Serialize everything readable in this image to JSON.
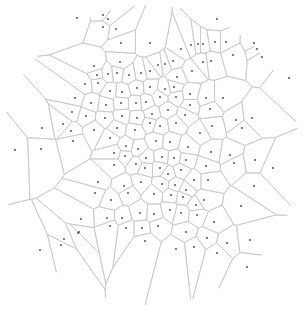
{
  "diagram": {
    "type": "voronoi",
    "width": 305,
    "height": 312,
    "colors": {
      "background": "#ffffff",
      "edge": "#c8c8c8",
      "seed": "#444444"
    },
    "clip_circle": {
      "cx": 150,
      "cy": 155,
      "r": 150
    },
    "seeds": [
      [
        103,
        15
      ],
      [
        108,
        19
      ],
      [
        103,
        27
      ],
      [
        116,
        29
      ],
      [
        77,
        18
      ],
      [
        121,
        43
      ],
      [
        150,
        43
      ],
      [
        181,
        49
      ],
      [
        217,
        19
      ],
      [
        94,
        66
      ],
      [
        120,
        62
      ],
      [
        150,
        71
      ],
      [
        173,
        61
      ],
      [
        191,
        45
      ],
      [
        198,
        44
      ],
      [
        203,
        44
      ],
      [
        215,
        42
      ],
      [
        226,
        42
      ],
      [
        254,
        43
      ],
      [
        262,
        57
      ],
      [
        289,
        78
      ],
      [
        97,
        75
      ],
      [
        108,
        74
      ],
      [
        117,
        73
      ],
      [
        129,
        75
      ],
      [
        141,
        73
      ],
      [
        158,
        65
      ],
      [
        165,
        64
      ],
      [
        177,
        77
      ],
      [
        192,
        71
      ],
      [
        203,
        62
      ],
      [
        211,
        61
      ],
      [
        233,
        55
      ],
      [
        257,
        49
      ],
      [
        85,
        84
      ],
      [
        98,
        83
      ],
      [
        110,
        91
      ],
      [
        122,
        92
      ],
      [
        137,
        88
      ],
      [
        150,
        87
      ],
      [
        165,
        89
      ],
      [
        174,
        87
      ],
      [
        190,
        94
      ],
      [
        206,
        98
      ],
      [
        223,
        98
      ],
      [
        75,
        98
      ],
      [
        91,
        103
      ],
      [
        106,
        105
      ],
      [
        121,
        103
      ],
      [
        136,
        103
      ],
      [
        146,
        102
      ],
      [
        160,
        97
      ],
      [
        176,
        97
      ],
      [
        190,
        105
      ],
      [
        210,
        109
      ],
      [
        236,
        120
      ],
      [
        72,
        112
      ],
      [
        86,
        116
      ],
      [
        105,
        118
      ],
      [
        122,
        116
      ],
      [
        137,
        118
      ],
      [
        152,
        114
      ],
      [
        168,
        110
      ],
      [
        185,
        115
      ],
      [
        212,
        126
      ],
      [
        242,
        128
      ],
      [
        252,
        118
      ],
      [
        42,
        128
      ],
      [
        63,
        124
      ],
      [
        71,
        131
      ],
      [
        73,
        141
      ],
      [
        94,
        130
      ],
      [
        117,
        128
      ],
      [
        135,
        130
      ],
      [
        150,
        123
      ],
      [
        160,
        126
      ],
      [
        176,
        123
      ],
      [
        200,
        133
      ],
      [
        15,
        150
      ],
      [
        41,
        149
      ],
      [
        73,
        141
      ],
      [
        110,
        138
      ],
      [
        126,
        146
      ],
      [
        138,
        149
      ],
      [
        156,
        141
      ],
      [
        170,
        142
      ],
      [
        188,
        147
      ],
      [
        211,
        152
      ],
      [
        230,
        155
      ],
      [
        114,
        153
      ],
      [
        125,
        156
      ],
      [
        146,
        158
      ],
      [
        162,
        157
      ],
      [
        174,
        158
      ],
      [
        186,
        160
      ],
      [
        206,
        166
      ],
      [
        234,
        163
      ],
      [
        255,
        160
      ],
      [
        273,
        168
      ],
      [
        114,
        165
      ],
      [
        136,
        164
      ],
      [
        145,
        168
      ],
      [
        160,
        168
      ],
      [
        168,
        174
      ],
      [
        181,
        170
      ],
      [
        194,
        180
      ],
      [
        208,
        180
      ],
      [
        254,
        186
      ],
      [
        98,
        182
      ],
      [
        124,
        186
      ],
      [
        141,
        182
      ],
      [
        162,
        184
      ],
      [
        175,
        185
      ],
      [
        186,
        190
      ],
      [
        204,
        200
      ],
      [
        241,
        206
      ],
      [
        95,
        193
      ],
      [
        111,
        200
      ],
      [
        128,
        193
      ],
      [
        154,
        194
      ],
      [
        171,
        195
      ],
      [
        183,
        197
      ],
      [
        196,
        205
      ],
      [
        214,
        222
      ],
      [
        81,
        219
      ],
      [
        107,
        218
      ],
      [
        122,
        218
      ],
      [
        140,
        213
      ],
      [
        154,
        214
      ],
      [
        170,
        210
      ],
      [
        181,
        213
      ],
      [
        197,
        215
      ],
      [
        110,
        226
      ],
      [
        126,
        228
      ],
      [
        142,
        228
      ],
      [
        158,
        226
      ],
      [
        186,
        232
      ],
      [
        207,
        238
      ],
      [
        227,
        243
      ],
      [
        250,
        240
      ],
      [
        145,
        241
      ],
      [
        176,
        249
      ],
      [
        194,
        247
      ],
      [
        217,
        253
      ],
      [
        247,
        267
      ],
      [
        78,
        233
      ],
      [
        79,
        232
      ],
      [
        61,
        245
      ],
      [
        64,
        239
      ],
      [
        40,
        250
      ]
    ]
  },
  "chart_data": {
    "type": "voronoi",
    "title": "",
    "point_count": 150,
    "edge_color": "#c8c8c8",
    "point_color": "#444444"
  }
}
